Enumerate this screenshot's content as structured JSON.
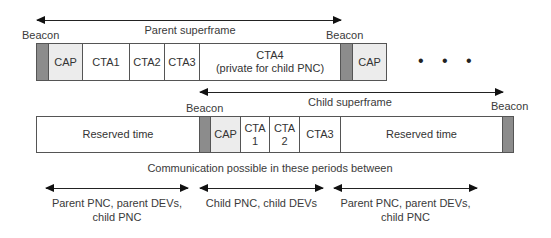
{
  "parent": {
    "superframe_label": "Parent superframe",
    "beacon_left": "Beacon",
    "beacon_right": "Beacon",
    "cap": "CAP",
    "cta1": "CTA1",
    "cta2": "CTA2",
    "cta3": "CTA3",
    "cta4_line1": "CTA4",
    "cta4_line2": "(private for child PNC)",
    "cap2": "CAP",
    "ellipsis": "• • •"
  },
  "child": {
    "superframe_label": "Child superframe",
    "beacon_left": "Beacon",
    "beacon_right": "Beacon",
    "reserved_left": "Reserved time",
    "cap": "CAP",
    "cta1_line1": "CTA",
    "cta1_line2": "1",
    "cta2_line1": "CTA",
    "cta2_line2": "2",
    "cta3": "CTA3",
    "reserved_right": "Reserved time"
  },
  "communication": {
    "heading": "Communication possible in these periods between",
    "periods": [
      {
        "line1": "Parent PNC, parent DEVs,",
        "line2": "child PNC"
      },
      {
        "line1": "Child PNC, child DEVs",
        "line2": ""
      },
      {
        "line1": "Parent PNC, parent DEVs,",
        "line2": "child PNC"
      }
    ]
  },
  "colors": {
    "beacon": "#8c8c8c",
    "cap": "#ececec",
    "border": "#555555"
  }
}
